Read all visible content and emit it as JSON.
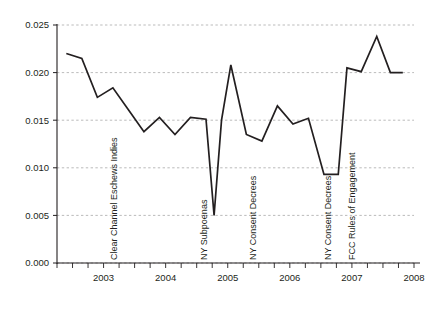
{
  "chart_data": {
    "type": "line",
    "title": "",
    "xlabel": "",
    "ylabel": "",
    "xlim": [
      2002.25,
      2008.0
    ],
    "ylim": [
      0.0,
      0.025
    ],
    "grid": true,
    "legend": "none",
    "x_tick_labels": [
      "2003",
      "2004",
      "2005",
      "2006",
      "2007",
      "2008"
    ],
    "x_tick_values": [
      2003,
      2004,
      2005,
      2006,
      2007,
      2008
    ],
    "x_minor_tick_interval": 0.25,
    "y_tick_labels": [
      "0.000",
      "0.005",
      "0.010",
      "0.015",
      "0.020",
      "0.025"
    ],
    "y_tick_values": [
      0.0,
      0.005,
      0.01,
      0.015,
      0.02,
      0.025
    ],
    "line_color": "#231f20",
    "grid_color": "#aaaaaa",
    "x": [
      2002.4,
      2002.65,
      2002.9,
      2003.15,
      2003.4,
      2003.65,
      2003.9,
      2004.15,
      2004.4,
      2004.65,
      2004.78,
      2004.9,
      2005.05,
      2005.3,
      2005.55,
      2005.8,
      2006.05,
      2006.3,
      2006.55,
      2006.78,
      2006.92,
      2007.15,
      2007.4,
      2007.62,
      2007.82
    ],
    "values": [
      0.022,
      0.0215,
      0.0174,
      0.0184,
      0.0161,
      0.0138,
      0.0153,
      0.0135,
      0.0153,
      0.0151,
      0.005,
      0.015,
      0.0208,
      0.0135,
      0.0128,
      0.0165,
      0.0146,
      0.0152,
      0.0093,
      0.0093,
      0.0205,
      0.0201,
      0.0238,
      0.02,
      0.02
    ],
    "annotations": [
      {
        "text": "Clear Channel Eschews Indies",
        "x_px": 117,
        "baseline_y_px": 260
      },
      {
        "text": "NY Subpoenas",
        "x_px": 207,
        "baseline_y_px": 260
      },
      {
        "text": "NY Consent Decrees",
        "x_px": 256,
        "baseline_y_px": 260
      },
      {
        "text": "NY Consent Decrees",
        "x_px": 331,
        "baseline_y_px": 260
      },
      {
        "text": "FCC Rules of Engagement",
        "x_px": 355,
        "baseline_y_px": 260
      }
    ]
  }
}
